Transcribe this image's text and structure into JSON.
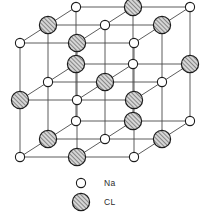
{
  "figure": {
    "background_color": "#ffffff",
    "width": 206,
    "height": 215
  },
  "lattice": {
    "type": "cubic-rock-salt",
    "cells_per_edge": 2,
    "nodes_per_edge": 3,
    "projection": "oblique-cabinet",
    "origin": {
      "x": 20,
      "y": 157
    },
    "axis_x": {
      "dx": 57,
      "dy": 0
    },
    "axis_y": {
      "dx": 0,
      "dy": -57
    },
    "axis_z": {
      "dx": 28,
      "dy": -18
    },
    "bond_color": "#4a4a4a",
    "bond_width": 0.9
  },
  "atoms": {
    "na": {
      "symbol": "Na",
      "name": "sodium-ion",
      "radius": 4.6,
      "fill": "#ffffff",
      "stroke": "#1c1c1c",
      "stroke_width": 1.1,
      "pattern": "none"
    },
    "cl": {
      "symbol": "CL",
      "name": "chloride-ion",
      "radius": 8.6,
      "fill": "#d4d4d4",
      "stroke": "#1c1c1c",
      "stroke_width": 1.2,
      "pattern": "diagonal-hatch",
      "hatch_color": "#3a3a3a",
      "hatch_angle": -45
    }
  },
  "legend": {
    "items": [
      {
        "id": "na",
        "label": "Na",
        "marker": "open-circle",
        "marker_x": 81,
        "marker_y": 183,
        "label_x": 104,
        "label_y": 186
      },
      {
        "id": "cl",
        "label": "CL",
        "marker": "hatched-circle",
        "marker_x": 81,
        "marker_y": 202,
        "label_x": 104,
        "label_y": 205
      }
    ]
  },
  "chart_data": {
    "type": "scatter",
    "xlabel": "",
    "ylabel": "",
    "legend_entries": [
      "Na",
      "CL"
    ],
    "grid": false,
    "series": [
      {
        "name": "Na",
        "marker": "open-circle",
        "points": [
          [
            0,
            0,
            0
          ],
          [
            2,
            0,
            0
          ],
          [
            0,
            2,
            0
          ],
          [
            2,
            2,
            0
          ],
          [
            1,
            1,
            0
          ],
          [
            0,
            1,
            1
          ],
          [
            1,
            0,
            1
          ],
          [
            1,
            2,
            1
          ],
          [
            2,
            1,
            1
          ],
          [
            0,
            0,
            2
          ],
          [
            2,
            0,
            2
          ],
          [
            0,
            2,
            2
          ],
          [
            2,
            2,
            2
          ],
          [
            1,
            1,
            2
          ]
        ]
      },
      {
        "name": "CL",
        "marker": "hatched-circle",
        "points": [
          [
            1,
            0,
            0
          ],
          [
            0,
            1,
            0
          ],
          [
            2,
            1,
            0
          ],
          [
            1,
            2,
            0
          ],
          [
            0,
            0,
            1
          ],
          [
            2,
            0,
            1
          ],
          [
            1,
            1,
            1
          ],
          [
            0,
            2,
            1
          ],
          [
            2,
            2,
            1
          ],
          [
            1,
            0,
            2
          ],
          [
            0,
            1,
            2
          ],
          [
            2,
            1,
            2
          ],
          [
            1,
            2,
            2
          ]
        ]
      }
    ]
  }
}
